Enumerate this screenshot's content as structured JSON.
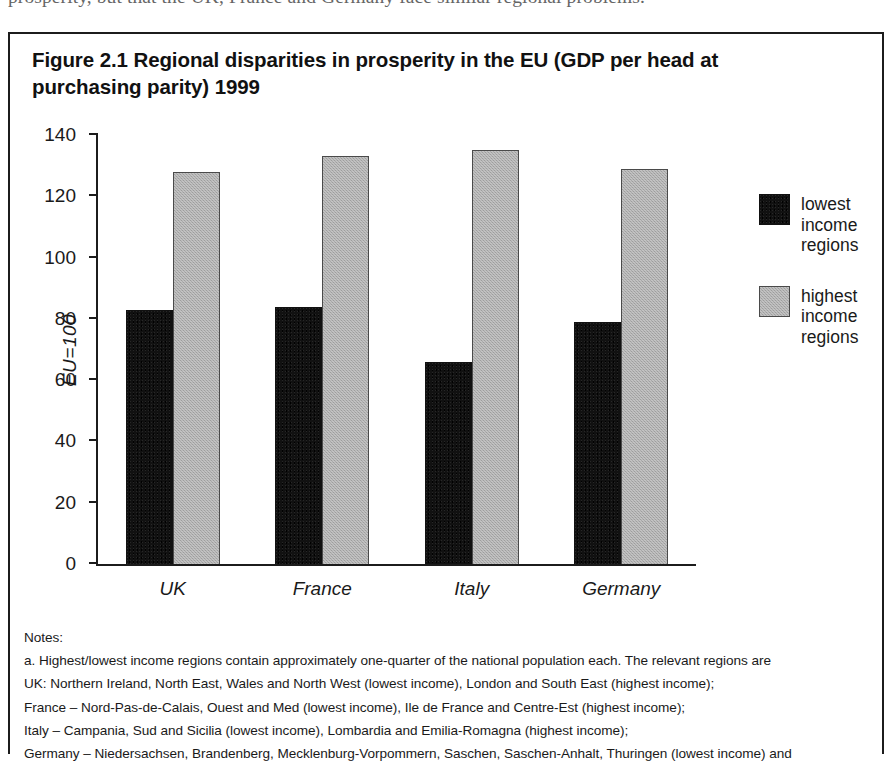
{
  "page": {
    "cut_off_body_text": "prosperity, but that the UK, France and Germany face similar regional problems."
  },
  "figure": {
    "title": "Figure 2.1 Regional disparities in prosperity in the EU (GDP per head at purchasing parity) 1999",
    "notes_heading": "Notes:",
    "notes": [
      "a. Highest/lowest income regions contain approximately one-quarter of the national population each. The relevant regions are",
      "UK: Northern Ireland, North East, Wales and North West (lowest income), London and South East (highest income);",
      "France – Nord-Pas-de-Calais, Ouest and Med (lowest income), Ile de France and Centre-Est (highest income);",
      "Italy – Campania, Sud and Sicilia (lowest income), Lombardia and Emilia-Romagna (highest income);",
      "Germany – Niedersachsen, Brandenberg, Mecklenburg-Vorpommern, Saschen, Saschen-Anhalt, Thuringen (lowest income) and"
    ]
  },
  "chart_data": {
    "type": "bar",
    "title": "Figure 2.1 Regional disparities in prosperity in the EU (GDP per head at purchasing parity) 1999",
    "xlabel": "",
    "ylabel": "EU=100",
    "ylim": [
      0,
      140
    ],
    "yticks": [
      0,
      20,
      40,
      60,
      80,
      100,
      120,
      140
    ],
    "ytick_labels": [
      "0",
      "20",
      "40",
      "60",
      "80",
      "100",
      "120",
      "140"
    ],
    "grid": false,
    "legend_position": "right",
    "categories": [
      "UK",
      "France",
      "Italy",
      "Germany"
    ],
    "series": [
      {
        "name": "lowest income regions",
        "color": "#111111",
        "values": [
          83,
          84,
          66,
          79
        ]
      },
      {
        "name": "highest income regions",
        "color": "#a9a9a9",
        "values": [
          128,
          133,
          135,
          129
        ]
      }
    ]
  },
  "legend": {
    "items": [
      {
        "label_line1": "lowest",
        "label_line2": "income",
        "label_line3": "regions",
        "swatch": "low"
      },
      {
        "label_line1": "highest",
        "label_line2": "income",
        "label_line3": "regions",
        "swatch": "high"
      }
    ]
  }
}
